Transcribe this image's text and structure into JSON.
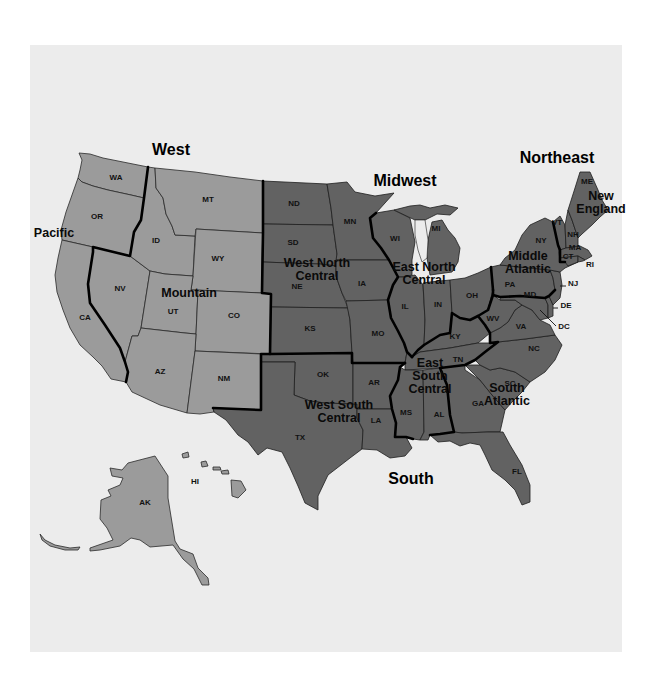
{
  "map": {
    "regions": [
      {
        "name": "West",
        "x": 171,
        "y": 155
      },
      {
        "name": "Midwest",
        "x": 405,
        "y": 186
      },
      {
        "name": "Northeast",
        "x": 557,
        "y": 163
      },
      {
        "name": "South",
        "x": 411,
        "y": 484
      }
    ],
    "divisions": [
      {
        "lines": [
          "Pacific"
        ],
        "x": 54,
        "y": 237
      },
      {
        "lines": [
          "Mountain"
        ],
        "x": 189,
        "y": 297
      },
      {
        "lines": [
          "West North",
          "Central"
        ],
        "x": 317,
        "y": 267
      },
      {
        "lines": [
          "East North",
          "Central"
        ],
        "x": 424,
        "y": 271
      },
      {
        "lines": [
          "Middle",
          "Atlantic"
        ],
        "x": 528,
        "y": 260
      },
      {
        "lines": [
          "New",
          "England"
        ],
        "x": 601,
        "y": 200
      },
      {
        "lines": [
          "West South",
          "Central"
        ],
        "x": 339,
        "y": 409
      },
      {
        "lines": [
          "East",
          "South",
          "Central"
        ],
        "x": 430,
        "y": 367
      },
      {
        "lines": [
          "South",
          "Atlantic"
        ],
        "x": 507,
        "y": 392
      }
    ],
    "states": [
      {
        "abbr": "WA",
        "x": 116,
        "y": 180,
        "division": "Pacific"
      },
      {
        "abbr": "OR",
        "x": 97,
        "y": 219,
        "division": "Pacific"
      },
      {
        "abbr": "CA",
        "x": 85,
        "y": 320,
        "division": "Pacific"
      },
      {
        "abbr": "AK",
        "x": 145,
        "y": 505,
        "division": "Pacific"
      },
      {
        "abbr": "HI",
        "x": 195,
        "y": 484,
        "division": "Pacific"
      },
      {
        "abbr": "MT",
        "x": 208,
        "y": 202,
        "division": "Mountain"
      },
      {
        "abbr": "ID",
        "x": 156,
        "y": 243,
        "division": "Mountain"
      },
      {
        "abbr": "WY",
        "x": 218,
        "y": 261,
        "division": "Mountain"
      },
      {
        "abbr": "NV",
        "x": 120,
        "y": 291,
        "division": "Mountain"
      },
      {
        "abbr": "UT",
        "x": 173,
        "y": 314,
        "division": "Mountain"
      },
      {
        "abbr": "CO",
        "x": 234,
        "y": 318,
        "division": "Mountain"
      },
      {
        "abbr": "AZ",
        "x": 160,
        "y": 374,
        "division": "Mountain"
      },
      {
        "abbr": "NM",
        "x": 224,
        "y": 381,
        "division": "Mountain"
      },
      {
        "abbr": "ND",
        "x": 294,
        "y": 206,
        "division": "West North Central"
      },
      {
        "abbr": "MN",
        "x": 350,
        "y": 224,
        "division": "West North Central"
      },
      {
        "abbr": "SD",
        "x": 293,
        "y": 245,
        "division": "West North Central"
      },
      {
        "abbr": "NE",
        "x": 297,
        "y": 289,
        "division": "West North Central"
      },
      {
        "abbr": "IA",
        "x": 362,
        "y": 286,
        "division": "West North Central"
      },
      {
        "abbr": "KS",
        "x": 310,
        "y": 331,
        "division": "West North Central"
      },
      {
        "abbr": "MO",
        "x": 378,
        "y": 336,
        "division": "West North Central"
      },
      {
        "abbr": "WI",
        "x": 395,
        "y": 241,
        "division": "East North Central"
      },
      {
        "abbr": "MI",
        "x": 436,
        "y": 231,
        "division": "East North Central"
      },
      {
        "abbr": "IL",
        "x": 405,
        "y": 309,
        "division": "East North Central"
      },
      {
        "abbr": "IN",
        "x": 438,
        "y": 307,
        "division": "East North Central"
      },
      {
        "abbr": "OH",
        "x": 472,
        "y": 298,
        "division": "East North Central"
      },
      {
        "abbr": "NY",
        "x": 541,
        "y": 243,
        "division": "Middle Atlantic"
      },
      {
        "abbr": "PA",
        "x": 510,
        "y": 287,
        "division": "Middle Atlantic"
      },
      {
        "abbr": "NJ",
        "x": 573,
        "y": 286,
        "division": "Middle Atlantic"
      },
      {
        "abbr": "ME",
        "x": 587,
        "y": 184,
        "division": "New England"
      },
      {
        "abbr": "VT",
        "x": 557,
        "y": 225,
        "division": "New England"
      },
      {
        "abbr": "NH",
        "x": 573,
        "y": 237,
        "division": "New England"
      },
      {
        "abbr": "MA",
        "x": 575,
        "y": 250,
        "division": "New England"
      },
      {
        "abbr": "CT",
        "x": 568,
        "y": 259,
        "division": "New England"
      },
      {
        "abbr": "RI",
        "x": 590,
        "y": 267,
        "division": "New England"
      },
      {
        "abbr": "OK",
        "x": 323,
        "y": 377,
        "division": "West South Central"
      },
      {
        "abbr": "TX",
        "x": 300,
        "y": 440,
        "division": "West South Central"
      },
      {
        "abbr": "AR",
        "x": 374,
        "y": 385,
        "division": "West South Central"
      },
      {
        "abbr": "LA",
        "x": 376,
        "y": 423,
        "division": "West South Central"
      },
      {
        "abbr": "KY",
        "x": 455,
        "y": 339,
        "division": "East South Central"
      },
      {
        "abbr": "TN",
        "x": 458,
        "y": 362,
        "division": "East South Central"
      },
      {
        "abbr": "MS",
        "x": 406,
        "y": 415,
        "division": "East South Central"
      },
      {
        "abbr": "AL",
        "x": 439,
        "y": 417,
        "division": "East South Central"
      },
      {
        "abbr": "WV",
        "x": 493,
        "y": 321,
        "division": "South Atlantic"
      },
      {
        "abbr": "VA",
        "x": 521,
        "y": 329,
        "division": "South Atlantic"
      },
      {
        "abbr": "MD",
        "x": 530,
        "y": 297,
        "division": "South Atlantic"
      },
      {
        "abbr": "DE",
        "x": 566,
        "y": 308,
        "division": "South Atlantic"
      },
      {
        "abbr": "DC",
        "x": 564,
        "y": 329,
        "division": "South Atlantic"
      },
      {
        "abbr": "NC",
        "x": 534,
        "y": 351,
        "division": "South Atlantic"
      },
      {
        "abbr": "SC",
        "x": 510,
        "y": 386,
        "division": "South Atlantic"
      },
      {
        "abbr": "GA",
        "x": 478,
        "y": 406,
        "division": "South Atlantic"
      },
      {
        "abbr": "FL",
        "x": 517,
        "y": 474,
        "division": "South Atlantic"
      }
    ],
    "colors": {
      "background": "#ffffff",
      "panel": "#ececec",
      "west_fill": "#9b9b9b",
      "other_fill": "#626262",
      "division_border": "#000000"
    }
  }
}
